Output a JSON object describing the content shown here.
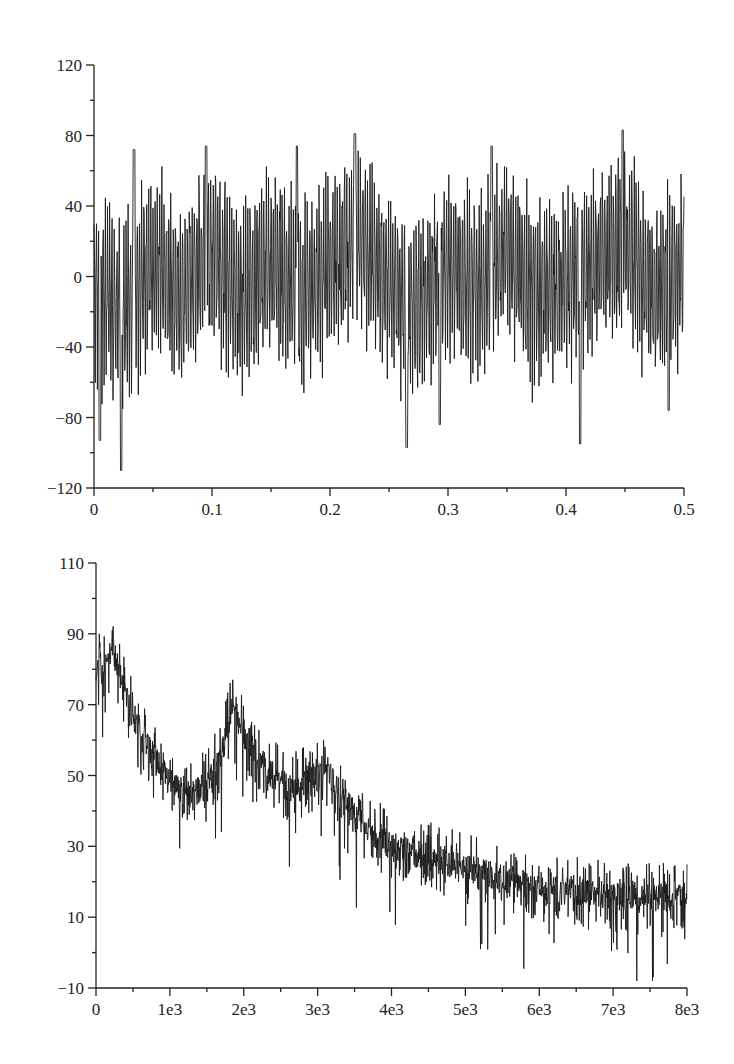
{
  "chart_data": [
    {
      "id": "time-signal",
      "type": "line",
      "title": "",
      "xlabel": "",
      "ylabel": "",
      "xlim": [
        0,
        0.5
      ],
      "ylim": [
        -120,
        120
      ],
      "grid": false,
      "legend": null,
      "x_ticks": [
        0,
        0.1,
        0.2,
        0.3,
        0.4,
        0.5
      ],
      "x_tick_labels": [
        "0",
        "0.1",
        "0.2",
        "0.3",
        "0.4",
        "0.5"
      ],
      "x_minor_step": 0.05,
      "y_ticks": [
        -120,
        -80,
        -40,
        0,
        40,
        80,
        120
      ],
      "y_tick_labels": [
        "−120",
        "−80",
        "−40",
        "0",
        "40",
        "80",
        "120"
      ],
      "y_minor_step": 20,
      "series": [
        {
          "name": "signal",
          "description": "Dense noisy oscillating signal, roughly zero-mean, amplitude mostly within ±80",
          "n_points": 1400,
          "seed": 7,
          "approx_extremes": [
            {
              "x": 0.005,
              "y": -93
            },
            {
              "x": 0.023,
              "y": -110
            },
            {
              "x": 0.034,
              "y": 72
            },
            {
              "x": 0.095,
              "y": 74
            },
            {
              "x": 0.172,
              "y": 74
            },
            {
              "x": 0.221,
              "y": 81
            },
            {
              "x": 0.265,
              "y": -97
            },
            {
              "x": 0.293,
              "y": -84
            },
            {
              "x": 0.337,
              "y": 74
            },
            {
              "x": 0.412,
              "y": -95
            },
            {
              "x": 0.448,
              "y": 83
            },
            {
              "x": 0.487,
              "y": -76
            }
          ],
          "sampled_values": {
            "x": [
              0,
              0.025,
              0.05,
              0.075,
              0.1,
              0.125,
              0.15,
              0.175,
              0.2,
              0.225,
              0.25,
              0.275,
              0.3,
              0.325,
              0.35,
              0.375,
              0.4,
              0.425,
              0.45,
              0.475,
              0.5
            ],
            "y": [
              -20,
              -60,
              20,
              -30,
              45,
              -40,
              30,
              -35,
              20,
              60,
              -15,
              -50,
              25,
              -20,
              40,
              -30,
              -10,
              20,
              60,
              -30,
              15
            ]
          }
        }
      ]
    },
    {
      "id": "spectrum",
      "type": "line",
      "title": "",
      "xlabel": "",
      "ylabel": "",
      "xlim": [
        0,
        8000
      ],
      "ylim": [
        -10,
        110
      ],
      "grid": false,
      "legend": null,
      "x_ticks": [
        0,
        1000,
        2000,
        3000,
        4000,
        5000,
        6000,
        7000,
        8000
      ],
      "x_tick_labels": [
        "0",
        "1e3",
        "2e3",
        "3e3",
        "4e3",
        "5e3",
        "6e3",
        "7e3",
        "8e3"
      ],
      "x_minor_step": 500,
      "y_ticks": [
        -10,
        10,
        30,
        50,
        70,
        90,
        110
      ],
      "y_tick_labels": [
        "−10",
        "10",
        "30",
        "50",
        "70",
        "90",
        "110"
      ],
      "y_minor_step": 10,
      "series": [
        {
          "name": "magnitude",
          "description": "Noisy decaying spectrum with resonance peaks near 200, 1850 and 3100",
          "n_points": 1800,
          "seed": 11,
          "envelope": {
            "x": [
              0,
              100,
              220,
              400,
              700,
              1000,
              1300,
              1500,
              1700,
              1850,
              2000,
              2300,
              2600,
              2900,
              3100,
              3300,
              3600,
              4000,
              4500,
              5000,
              5500,
              6000,
              6500,
              7000,
              7500,
              8000
            ],
            "y": [
              82,
              79,
              86,
              72,
              58,
              48,
              45,
              47,
              56,
              70,
              62,
              52,
              46,
              49,
              53,
              45,
              36,
              30,
              27,
              24,
              21,
              18,
              17,
              16,
              16,
              15
            ]
          },
          "noise_amplitude": 4,
          "dip_depth_max": 22,
          "approx_peaks": [
            {
              "x": 220,
              "y": 91
            },
            {
              "x": 1850,
              "y": 77
            },
            {
              "x": 3100,
              "y": 58
            }
          ]
        }
      ]
    }
  ]
}
